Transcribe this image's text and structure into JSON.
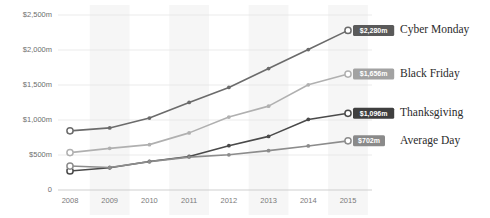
{
  "chart_data": {
    "type": "line",
    "title": "",
    "xlabel": "",
    "ylabel": "",
    "x": [
      "2008",
      "2009",
      "2010",
      "2011",
      "2012",
      "2013",
      "2014",
      "2015"
    ],
    "categories": [
      "2008",
      "2009",
      "2010",
      "2011",
      "2012",
      "2013",
      "2014",
      "2015"
    ],
    "ylim": [
      0,
      2500
    ],
    "ytick_labels": [
      "$2,500m",
      "$2,000m",
      "$1,500m",
      "$1,000m",
      "$500m",
      "0"
    ],
    "ytick_values": [
      2500,
      2000,
      1500,
      1000,
      500,
      0
    ],
    "grid": true,
    "legend_position": "right",
    "series": [
      {
        "name": "Cyber Monday",
        "color": "#6b6b6b",
        "end_label": "$2,280m",
        "end_value": 2280,
        "badge_color": "#5a5a5a",
        "values": [
          845,
          887,
          1028,
          1251,
          1465,
          1735,
          2006,
          2280
        ]
      },
      {
        "name": "Black Friday",
        "color": "#b0b0b0",
        "end_label": "$1,656m",
        "end_value": 1656,
        "badge_color": "#a2a2a2",
        "values": [
          534,
          595,
          648,
          816,
          1042,
          1198,
          1503,
          1656
        ]
      },
      {
        "name": "Thanksgiving",
        "color": "#4a4a4a",
        "end_label": "$1,096m",
        "end_value": 1096,
        "badge_color": "#3f3f3f",
        "values": [
          272,
          318,
          407,
          479,
          633,
          766,
          1008,
          1096
        ]
      },
      {
        "name": "Average Day",
        "color": "#8c8c8c",
        "end_label": "$702m",
        "end_value": 702,
        "badge_color": "#8a8a8a",
        "values": [
          342,
          322,
          405,
          470,
          503,
          562,
          629,
          702
        ]
      }
    ]
  },
  "colors": {
    "background": "#ffffff",
    "band": "#f2f2f2",
    "gridline": "#e6e6e6",
    "axis": "#c9c9c9",
    "tick_text": "#6e6e6e",
    "legend_text": "#2b2b2b"
  }
}
